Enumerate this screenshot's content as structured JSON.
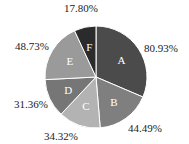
{
  "chart_data": {
    "type": "pie",
    "title": "",
    "start_angle_deg": 0,
    "direction": "clockwise",
    "categories": [
      "A",
      "B",
      "C",
      "D",
      "E",
      "F"
    ],
    "values": [
      80.93,
      44.49,
      34.32,
      31.36,
      48.73,
      17.8
    ],
    "labels": [
      "80.93%",
      "44.49%",
      "34.32%",
      "31.36%",
      "48.73%",
      "17.80%"
    ],
    "colors": [
      "#4b4b4b",
      "#7f7f7f",
      "#b3b3b3",
      "#767676",
      "#9a9a9a",
      "#2b2b2b"
    ],
    "legend": "none",
    "label_positions": [
      {
        "x": 144,
        "y": 52,
        "anchor": "start"
      },
      {
        "x": 128,
        "y": 132,
        "anchor": "start"
      },
      {
        "x": 44,
        "y": 140,
        "anchor": "start"
      },
      {
        "x": 14,
        "y": 108,
        "anchor": "start"
      },
      {
        "x": 15,
        "y": 50,
        "anchor": "start"
      },
      {
        "x": 64,
        "y": 12,
        "anchor": "start"
      }
    ],
    "geometry": {
      "cx": 96,
      "cy": 77,
      "r": 51
    }
  }
}
